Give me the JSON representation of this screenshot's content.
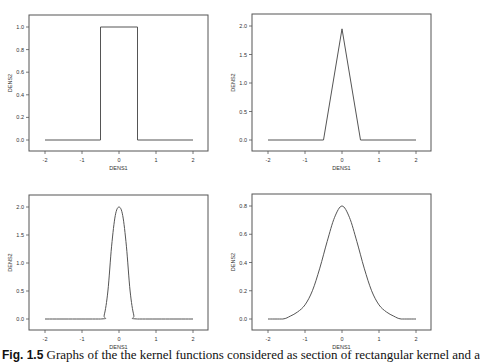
{
  "figure": {
    "caption_label": "Fig. 1.5",
    "caption_text": "Graphs of the the kernel functions considered as section of rectangular kernel and a"
  },
  "chart_data": [
    {
      "type": "line",
      "title": "",
      "xlabel": "DENS1",
      "ylabel": "DENS2",
      "xlim": [
        -2,
        2
      ],
      "ylim": [
        0,
        1.0
      ],
      "xticks": [
        "-2",
        "-1",
        "0",
        "1",
        "2"
      ],
      "yticks": [
        "0.0",
        "0.2",
        "0.4",
        "0.6",
        "0.8",
        "1.0"
      ],
      "ytick_values": [
        0,
        0.2,
        0.4,
        0.6,
        0.8,
        1.0
      ],
      "grid": false,
      "kernel": "rectangular",
      "x": [
        -2,
        -0.5,
        -0.5,
        0.5,
        0.5,
        2
      ],
      "y": [
        0,
        0,
        1.0,
        1.0,
        0,
        0
      ]
    },
    {
      "type": "line",
      "title": "",
      "xlabel": "DENS1",
      "ylabel": "DENS2",
      "xlim": [
        -2,
        2
      ],
      "ylim": [
        0,
        2.0
      ],
      "xticks": [
        "-2",
        "-1",
        "0",
        "1",
        "2"
      ],
      "yticks": [
        "0.0",
        "0.5",
        "1.0",
        "1.5",
        "2.0"
      ],
      "ytick_values": [
        0,
        0.5,
        1.0,
        1.5,
        2.0
      ],
      "grid": false,
      "kernel": "triangular",
      "x": [
        -2,
        -0.5,
        0,
        0.5,
        2
      ],
      "y": [
        0,
        0,
        1.95,
        0,
        0
      ]
    },
    {
      "type": "line",
      "title": "",
      "xlabel": "DENS1",
      "ylabel": "DENS2",
      "xlim": [
        -2,
        2
      ],
      "ylim": [
        0,
        2.0
      ],
      "xticks": [
        "-2",
        "-1",
        "0",
        "1",
        "2"
      ],
      "yticks": [
        "0.0",
        "0.5",
        "1.0",
        "1.5",
        "2.0"
      ],
      "ytick_values": [
        0,
        0.5,
        1.0,
        1.5,
        2.0
      ],
      "grid": false,
      "kernel": "smooth-compact",
      "x": [
        -2,
        -0.5,
        -0.4,
        -0.3,
        -0.2,
        -0.1,
        0,
        0.1,
        0.2,
        0.3,
        0.4,
        0.5,
        2
      ],
      "y": [
        0,
        0,
        0.07,
        0.5,
        1.3,
        1.85,
        2.0,
        1.85,
        1.3,
        0.5,
        0.07,
        0,
        0
      ]
    },
    {
      "type": "line",
      "title": "",
      "xlabel": "DENS1",
      "ylabel": "DENS2",
      "xlim": [
        -2,
        2
      ],
      "ylim": [
        0,
        0.8
      ],
      "xticks": [
        "-2",
        "-1",
        "0",
        "1",
        "2"
      ],
      "yticks": [
        "0.0",
        "0.2",
        "0.4",
        "0.6",
        "0.8"
      ],
      "ytick_values": [
        0,
        0.2,
        0.4,
        0.6,
        0.8
      ],
      "grid": false,
      "kernel": "gaussian-like",
      "x": [
        -2,
        -1.6,
        -1.4,
        -1.2,
        -1.0,
        -0.8,
        -0.6,
        -0.4,
        -0.2,
        0,
        0.2,
        0.4,
        0.6,
        0.8,
        1.0,
        1.2,
        1.4,
        1.6,
        2
      ],
      "y": [
        0,
        0,
        0.02,
        0.05,
        0.1,
        0.2,
        0.36,
        0.55,
        0.72,
        0.8,
        0.72,
        0.55,
        0.36,
        0.2,
        0.1,
        0.05,
        0.02,
        0,
        0
      ]
    }
  ]
}
